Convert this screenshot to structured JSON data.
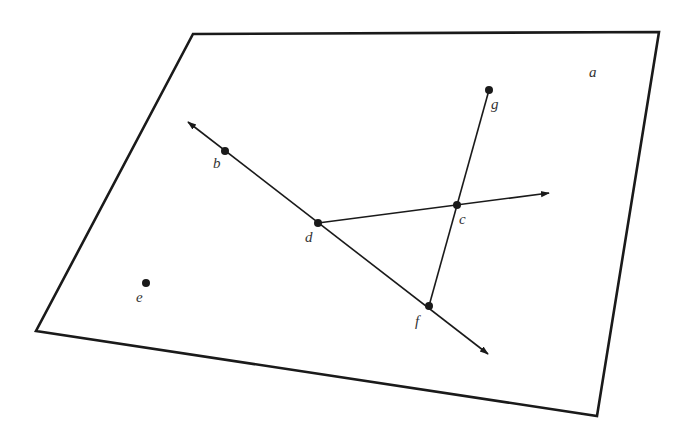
{
  "diagram": {
    "type": "geometry-plane",
    "plane": {
      "label": "a",
      "corners": [
        [
          193,
          34
        ],
        [
          659,
          32
        ],
        [
          597,
          416
        ],
        [
          36,
          331
        ]
      ],
      "label_pos": [
        589,
        77
      ]
    },
    "points": [
      {
        "id": "b",
        "label": "b",
        "x": 225,
        "y": 151,
        "label_x": 213,
        "label_y": 168
      },
      {
        "id": "c",
        "label": "c",
        "x": 457,
        "y": 205,
        "label_x": 459,
        "label_y": 224
      },
      {
        "id": "d",
        "label": "d",
        "x": 318,
        "y": 223,
        "label_x": 305,
        "label_y": 242
      },
      {
        "id": "e",
        "label": "e",
        "x": 146,
        "y": 283,
        "label_x": 136,
        "label_y": 302
      },
      {
        "id": "f",
        "label": "f",
        "x": 429,
        "y": 306,
        "label_x": 415,
        "label_y": 326
      },
      {
        "id": "g",
        "label": "g",
        "x": 489,
        "y": 90,
        "label_x": 491,
        "label_y": 109
      }
    ],
    "lines": [
      {
        "id": "line-bdf",
        "kind": "line",
        "x1": 188,
        "y1": 122,
        "x2": 488,
        "y2": 354,
        "arrow_start": true,
        "arrow_end": true
      },
      {
        "id": "ray-dc",
        "kind": "ray",
        "x1": 318,
        "y1": 223,
        "x2": 549,
        "y2": 193,
        "arrow_start": false,
        "arrow_end": true
      },
      {
        "id": "segment-gf",
        "kind": "segment",
        "x1": 489,
        "y1": 90,
        "x2": 429,
        "y2": 306,
        "arrow_start": false,
        "arrow_end": false
      }
    ],
    "colors": {
      "stroke": "#1a1a1a",
      "label": "#333333",
      "background": "#ffffff"
    }
  }
}
